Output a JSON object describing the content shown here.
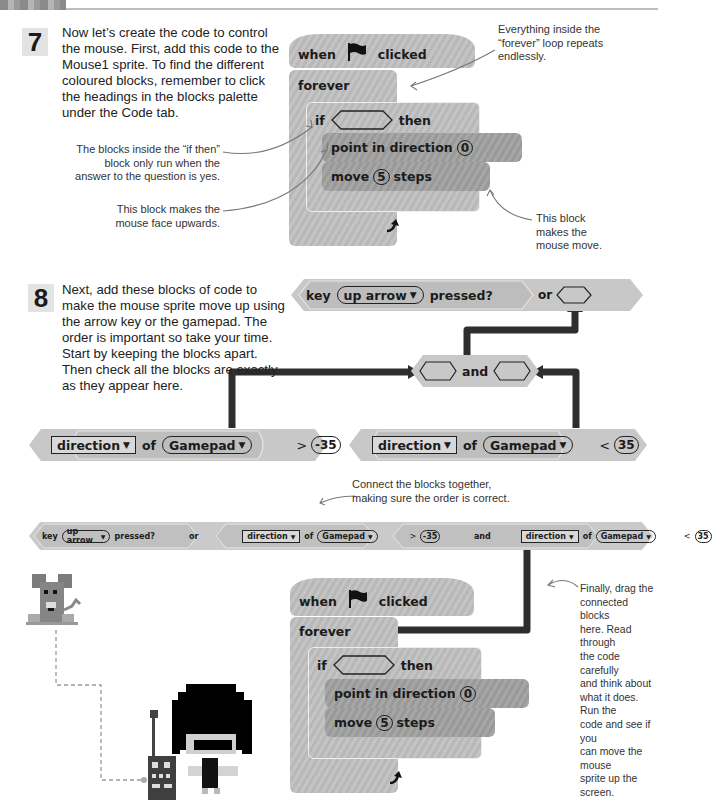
{
  "header": {
    "section_title": "CREATE IT: MOUSE"
  },
  "step7": {
    "number": "7",
    "text_lines": [
      "Now let’s create the code to control",
      "the mouse. First, add this code to the",
      "Mouse1 sprite. To find the different",
      "coloured blocks, remember to click",
      "the headings in the blocks palette",
      "under the Code tab."
    ],
    "notes": {
      "if_then": [
        "The blocks inside the “if then”",
        "block only run when the",
        "answer to the question is yes."
      ],
      "face_up": [
        "This block makes the",
        "mouse face upwards."
      ],
      "forever": [
        "Everything inside the",
        "“forever” loop repeats",
        "endlessly."
      ],
      "move": [
        "This block",
        "makes the",
        "mouse move."
      ]
    },
    "script": {
      "hat_when": "when",
      "hat_clicked": "clicked",
      "forever": "forever",
      "if": "if",
      "then": "then",
      "point": "point in direction",
      "point_value": "0",
      "move": "move",
      "move_value": "5",
      "steps": "steps"
    }
  },
  "step8": {
    "number": "8",
    "text_lines": [
      "Next, add these blocks of code to",
      "make the mouse sprite move up using",
      "the arrow key or the gamepad. The",
      "order is important so take your time.",
      "Start by keeping the blocks apart.",
      "Then check all the blocks are exactly",
      "as they appear here."
    ],
    "key_block": {
      "key": "key",
      "option": "up arrow",
      "pressed": "pressed?",
      "or": "or"
    },
    "and_block": {
      "and": "and"
    },
    "left_compare": {
      "attr": "direction",
      "of": "of",
      "object": "Gamepad",
      "op": ">",
      "value": "-35"
    },
    "right_compare": {
      "attr": "direction",
      "of": "of",
      "object": "Gamepad",
      "op": "<",
      "value": "35"
    },
    "connect_note": [
      "Connect the blocks together,",
      "making sure the order is correct."
    ],
    "final_note": [
      "Finally, drag the",
      "connected blocks",
      "here. Read through",
      "the code carefully",
      "and think about",
      "what it does. Run the",
      "code and see if you",
      "can move the mouse",
      "sprite up the screen."
    ],
    "script": {
      "hat_when": "when",
      "hat_clicked": "clicked",
      "forever": "forever",
      "if": "if",
      "then": "then",
      "point": "point in direction",
      "point_value": "0",
      "move": "move",
      "move_value": "5",
      "steps": "steps"
    }
  },
  "icons": {
    "flag": "green-flag-icon",
    "loop_arrow": "loop-arrow-icon",
    "dropdown": "▼"
  },
  "colors": {
    "block_light": "#c2c2c2",
    "block_dark": "#9e9e9e",
    "arrow": "#333333"
  }
}
